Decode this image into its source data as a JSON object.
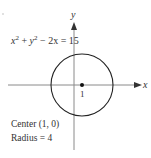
{
  "diagram": {
    "equation_parts": {
      "x": "x",
      "sup1": "2",
      "plus": " + ",
      "y": "y",
      "sup2": "2",
      "rest": " − 2x = 15"
    },
    "y_axis_label": "y",
    "x_axis_label": "x",
    "center_tick_label": "1",
    "center_text": "Center (1, 0)",
    "radius_text": "Radius = 4",
    "colors": {
      "axis": "#888888",
      "circle": "#222222",
      "text": "#333333"
    }
  }
}
